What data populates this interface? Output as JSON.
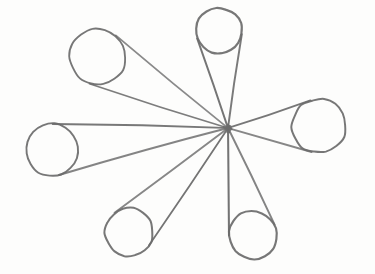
{
  "canvas": {
    "width": 375,
    "height": 274,
    "paper_color": "#fdfdfc",
    "pencil_color": "#6b6b6b",
    "hub_dot_color": "#4f4f4f",
    "base_stroke_width": 1.5
  },
  "figure": {
    "kind": "hand-drawn pencil sketch",
    "hub": {
      "x": 228,
      "y": 128
    },
    "petals": [
      {
        "name": "top",
        "cx": 219,
        "cy": 31,
        "r": 23
      },
      {
        "name": "upper-left",
        "cx": 98,
        "cy": 57,
        "r": 28
      },
      {
        "name": "left",
        "cx": 52,
        "cy": 150,
        "r": 26
      },
      {
        "name": "lower-left",
        "cx": 129,
        "cy": 232,
        "r": 24
      },
      {
        "name": "lower-right",
        "cx": 253,
        "cy": 235,
        "r": 24
      },
      {
        "name": "right",
        "cx": 319,
        "cy": 126,
        "r": 27
      }
    ]
  }
}
